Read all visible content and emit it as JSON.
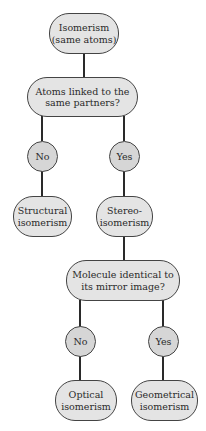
{
  "diagram": {
    "type": "decision-tree",
    "colors": {
      "box_fill": "#e4e4e4",
      "circle_fill": "#d6d6d6",
      "outline": "#444444",
      "connector": "#2a2a2a"
    },
    "nodes": {
      "root": "Isomerism\n(same atoms)",
      "q1": "Atoms linked to the\nsame partners?",
      "q1_no": "No",
      "q1_yes": "Yes",
      "structural": "Structural\nisomerism",
      "stereo": "Stereo-\nisomerism",
      "q2": "Molecule identical to\nits mirror image?",
      "q2_no": "No",
      "q2_yes": "Yes",
      "optical": "Optical\nisomerism",
      "geometrical": "Geometrical\nisomerism"
    },
    "edges": [
      [
        "root",
        "q1"
      ],
      [
        "q1",
        "q1_no"
      ],
      [
        "q1",
        "q1_yes"
      ],
      [
        "q1_no",
        "structural"
      ],
      [
        "q1_yes",
        "stereo"
      ],
      [
        "stereo",
        "q2"
      ],
      [
        "q2",
        "q2_no"
      ],
      [
        "q2",
        "q2_yes"
      ],
      [
        "q2_no",
        "optical"
      ],
      [
        "q2_yes",
        "geometrical"
      ]
    ]
  }
}
